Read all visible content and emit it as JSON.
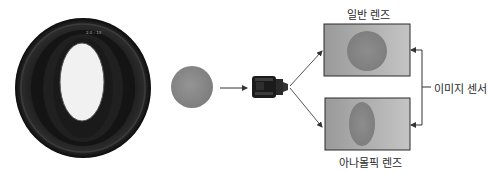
{
  "diagram": {
    "type": "anamorphic-lens-comparison",
    "labels": {
      "normal_lens": "일반 렌즈",
      "anamorphic_lens": "아나몰픽 렌즈",
      "image_sensor": "이미지 센서"
    },
    "icons": {
      "large_lens": "anamorphic-lens-front-photo",
      "subject": "sphere",
      "small_lens": "camera-lens"
    },
    "colors": {
      "lens_body": "#111111",
      "lens_opening": "#f2f2f2",
      "sphere": "#8a8a8a",
      "sensor_fill": "#a8a8a8",
      "sensor_border": "#2a2a2a",
      "projection": "#7a7a7a",
      "arrow": "#333333",
      "text": "#2a2a2a"
    }
  }
}
